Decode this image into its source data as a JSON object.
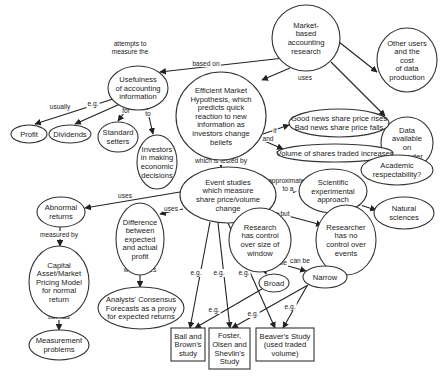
{
  "diagram": {
    "type": "concept-map",
    "nodes": [
      {
        "id": "mba",
        "shape": "circle",
        "lines": [
          "Market-",
          "based",
          "accounting",
          "research"
        ]
      },
      {
        "id": "usefulness",
        "shape": "ellipse",
        "lines": [
          "Usefulness",
          "of accounting",
          "information"
        ]
      },
      {
        "id": "emh",
        "shape": "circle",
        "lines": [
          "Efficient Market",
          "Hypothesis, which",
          "predicts quick",
          "reaction to new",
          "information as",
          "investors change",
          "beliefs"
        ]
      },
      {
        "id": "other_users",
        "shape": "circle",
        "lines": [
          "Other users",
          "and the",
          "cost",
          "of data",
          "production"
        ]
      },
      {
        "id": "data_available",
        "shape": "circle",
        "lines": [
          "Data",
          "available",
          "on",
          "computer"
        ]
      },
      {
        "id": "profit",
        "shape": "ellipse",
        "lines": [
          "Profit"
        ]
      },
      {
        "id": "dividends",
        "shape": "ellipse",
        "lines": [
          "Dividends"
        ]
      },
      {
        "id": "standard_setters",
        "shape": "ellipse",
        "lines": [
          "Standard",
          "setters"
        ]
      },
      {
        "id": "investors",
        "shape": "ellipse",
        "lines": [
          "Investors",
          "in making",
          "economic",
          "decisions"
        ]
      },
      {
        "id": "good_bad_news",
        "shape": "ellipse",
        "lines": [
          "Good news share price rises",
          "Bad news share price falls"
        ]
      },
      {
        "id": "volume",
        "shape": "ellipse",
        "lines": [
          "Volume of shares traded increases"
        ]
      },
      {
        "id": "event_studies",
        "shape": "ellipse",
        "lines": [
          "Event studies",
          "which measure",
          "share price/volume",
          "change"
        ]
      },
      {
        "id": "scientific",
        "shape": "ellipse",
        "lines": [
          "Scientific",
          "experimental",
          "approach"
        ]
      },
      {
        "id": "academic",
        "shape": "ellipse",
        "lines": [
          "Academic",
          "respectability?"
        ]
      },
      {
        "id": "natural_sciences",
        "shape": "ellipse",
        "lines": [
          "Natural",
          "sciences"
        ]
      },
      {
        "id": "abnormal_returns",
        "shape": "ellipse",
        "lines": [
          "Abnormal",
          "returns"
        ]
      },
      {
        "id": "difference",
        "shape": "ellipse",
        "lines": [
          "Difference",
          "between",
          "expected",
          "and actual",
          "profit"
        ]
      },
      {
        "id": "research_control",
        "shape": "circle",
        "lines": [
          "Research",
          "has control",
          "over size of",
          "window"
        ]
      },
      {
        "id": "researcher_no_control",
        "shape": "circle",
        "lines": [
          "Researcher",
          "has no",
          "control over",
          "events"
        ]
      },
      {
        "id": "capm",
        "shape": "ellipse",
        "lines": [
          "Capital",
          "Asset/Market",
          "Pricing Model",
          "for normal",
          "return"
        ]
      },
      {
        "id": "analysts",
        "shape": "ellipse",
        "lines": [
          "Analysts' Consensus",
          "Forecasts as a proxy",
          "for expected returns"
        ]
      },
      {
        "id": "broad",
        "shape": "ellipse",
        "lines": [
          "Broad"
        ]
      },
      {
        "id": "narrow",
        "shape": "ellipse",
        "lines": [
          "Narrow"
        ]
      },
      {
        "id": "measurement",
        "shape": "ellipse",
        "lines": [
          "Measurement",
          "problems"
        ]
      },
      {
        "id": "ball_brown",
        "shape": "box",
        "lines": [
          "Ball and",
          "Brown's",
          "study"
        ]
      },
      {
        "id": "foster",
        "shape": "box",
        "lines": [
          "Foster,",
          "Olsen and",
          "Shevlin's",
          "Study"
        ]
      },
      {
        "id": "beaver",
        "shape": "box",
        "lines": [
          "Beaver's Study",
          "(used traded",
          "volume)"
        ]
      }
    ],
    "edges": [
      {
        "from": "mba",
        "to": "usefulness",
        "label": [
          "attempts to",
          "measure the"
        ]
      },
      {
        "from": "mba",
        "to": "emh",
        "label": [
          "based on"
        ]
      },
      {
        "from": "mba",
        "to": "other_users",
        "label": [
          "ignores"
        ]
      },
      {
        "from": "mba",
        "to": "data_available",
        "label": [
          "uses"
        ]
      },
      {
        "from": "usefulness",
        "to": "profit",
        "label": [
          "usually"
        ]
      },
      {
        "from": "usefulness",
        "to": "dividends",
        "label": [
          "e.g."
        ]
      },
      {
        "from": "usefulness",
        "to": "standard_setters",
        "label": [
          "for"
        ]
      },
      {
        "from": "usefulness",
        "to": "investors",
        "label": [
          "to"
        ]
      },
      {
        "from": "emh",
        "to": "good_bad_news",
        "label": [
          "if"
        ]
      },
      {
        "from": "emh",
        "to": "volume",
        "label": [
          "and"
        ]
      },
      {
        "from": "emh",
        "to": "event_studies",
        "label": [
          "which is tested by"
        ]
      },
      {
        "from": "event_studies",
        "to": "scientific",
        "label": [
          "approximates",
          "to a"
        ]
      },
      {
        "from": "scientific",
        "to": "academic",
        "label": [
          "so",
          "giving"
        ]
      },
      {
        "from": "scientific",
        "to": "natural_sciences",
        "label": [
          "as used",
          "in the"
        ]
      },
      {
        "from": "event_studies",
        "to": "abnormal_returns",
        "label": [
          "uses"
        ]
      },
      {
        "from": "event_studies",
        "to": "difference",
        "label": [
          "uses"
        ]
      },
      {
        "from": "event_studies",
        "to": "research_control",
        "label": []
      },
      {
        "from": "event_studies",
        "to": "researcher_no_control",
        "label": [
          "but"
        ]
      },
      {
        "from": "abnormal_returns",
        "to": "capm",
        "label": [
          "measured by"
        ]
      },
      {
        "from": "capm",
        "to": "measurement",
        "label": [
          "but has"
        ]
      },
      {
        "from": "difference",
        "to": "analysts",
        "label": [
          "which uses"
        ]
      },
      {
        "from": "research_control",
        "to": "broad",
        "label": [
          "can be"
        ]
      },
      {
        "from": "research_control",
        "to": "narrow",
        "label": [
          "can be"
        ]
      },
      {
        "from": "event_studies",
        "to": "ball_brown",
        "label": [
          "e.g."
        ]
      },
      {
        "from": "event_studies",
        "to": "foster",
        "label": [
          "e.g."
        ]
      },
      {
        "from": "event_studies",
        "to": "beaver",
        "label": [
          "e.g."
        ]
      },
      {
        "from": "broad",
        "to": "ball_brown",
        "label": [
          "e.g."
        ]
      },
      {
        "from": "narrow",
        "to": "foster",
        "label": [
          "e.g."
        ]
      },
      {
        "from": "narrow",
        "to": "beaver",
        "label": [
          "e.g."
        ]
      }
    ]
  }
}
